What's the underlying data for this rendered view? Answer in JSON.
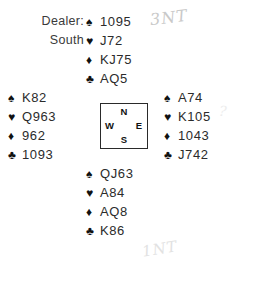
{
  "dealer": {
    "label": "Dealer:",
    "value": "South"
  },
  "suit_symbols": {
    "spade": "♠",
    "heart": "♥",
    "diamond": "♦",
    "club": "♣"
  },
  "compass": {
    "north": "N",
    "west": "W",
    "east": "E",
    "south": "S"
  },
  "hands": {
    "north": {
      "position": "North",
      "spades": "1095",
      "hearts": "J72",
      "diamonds": "KJ75",
      "clubs": "AQ5"
    },
    "west": {
      "position": "West",
      "spades": "K82",
      "hearts": "Q963",
      "diamonds": "962",
      "clubs": "1093"
    },
    "east": {
      "position": "East",
      "spades": "A74",
      "hearts": "K105",
      "diamonds": "1043",
      "clubs": "J742"
    },
    "south": {
      "position": "South",
      "spades": "QJ63",
      "hearts": "A84",
      "diamonds": "AQ8",
      "clubs": "K86"
    }
  },
  "annotations": {
    "top_right": "3NT",
    "bottom": "1NT",
    "east_mark": "?",
    "west_mark": ""
  },
  "colors": {
    "ink": "#2b2b2b",
    "pencil": "#c9c9c9",
    "background": "#ffffff"
  }
}
